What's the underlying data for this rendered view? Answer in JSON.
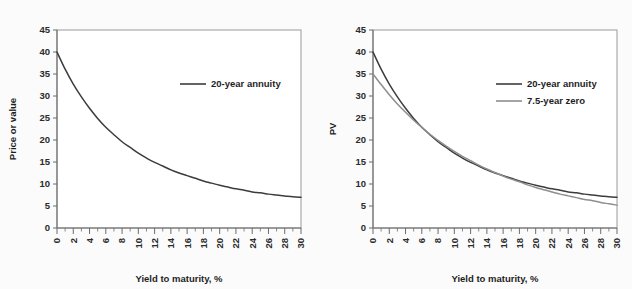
{
  "figure": {
    "background_color": "#fbfbfb",
    "panel_background_color": "#ffffff"
  },
  "colors": {
    "annuity": "#3c3c3c",
    "zero": "#8e8e8e",
    "axis": "#6d6d6d",
    "frame": "#9a9a9a",
    "text": "#1e1e1e"
  },
  "chart_data": [
    {
      "panel": "left",
      "type": "line",
      "title": "",
      "xlabel": "Yield to maturity, %",
      "ylabel": "Price or value",
      "xlim": [
        0,
        30
      ],
      "ylim": [
        0,
        45
      ],
      "xticks": [
        0,
        2,
        4,
        6,
        8,
        10,
        12,
        14,
        16,
        18,
        20,
        22,
        24,
        26,
        28,
        30
      ],
      "xticklabels": [
        "0",
        "2",
        "4",
        "6",
        "8",
        "10",
        "12",
        "14",
        "16",
        "18",
        "20",
        "22",
        "24",
        "26",
        "28",
        "30"
      ],
      "xminorticks": [
        1,
        3,
        5,
        7,
        9,
        11,
        13,
        15,
        17,
        19,
        21,
        23,
        25,
        27,
        29
      ],
      "yticks": [
        0,
        5,
        10,
        15,
        20,
        25,
        30,
        35,
        40,
        45
      ],
      "yticklabels": [
        "0",
        "5",
        "10",
        "15",
        "20",
        "25",
        "30",
        "35",
        "40",
        "45"
      ],
      "grid": false,
      "legend_position": "upper-right-inset",
      "series": [
        {
          "name": "20-year annuity",
          "color": "#3c3c3c",
          "x": [
            0,
            1,
            2,
            3,
            4,
            5,
            6,
            7,
            8,
            9,
            10,
            11,
            12,
            13,
            14,
            15,
            16,
            17,
            18,
            19,
            20,
            21,
            22,
            23,
            24,
            25,
            26,
            27,
            28,
            29,
            30
          ],
          "values": [
            40.0,
            36.1,
            32.7,
            29.8,
            27.2,
            24.9,
            22.9,
            21.2,
            19.6,
            18.3,
            17.0,
            15.9,
            14.9,
            14.1,
            13.2,
            12.5,
            11.9,
            11.3,
            10.7,
            10.2,
            9.7,
            9.3,
            8.9,
            8.6,
            8.2,
            8.0,
            7.7,
            7.5,
            7.3,
            7.1,
            7.0
          ]
        }
      ]
    },
    {
      "panel": "right",
      "type": "line",
      "title": "",
      "xlabel": "Yield to maturity, %",
      "ylabel": "PV",
      "xlim": [
        0,
        30
      ],
      "ylim": [
        0,
        45
      ],
      "xticks": [
        0,
        2,
        4,
        6,
        8,
        10,
        12,
        14,
        16,
        18,
        20,
        22,
        24,
        26,
        28,
        30
      ],
      "xticklabels": [
        "0",
        "2",
        "4",
        "6",
        "8",
        "10",
        "12",
        "14",
        "16",
        "18",
        "20",
        "22",
        "24",
        "26",
        "28",
        "30"
      ],
      "xminorticks": [
        1,
        3,
        5,
        7,
        9,
        11,
        13,
        15,
        17,
        19,
        21,
        23,
        25,
        27,
        29
      ],
      "yticks": [
        0,
        5,
        10,
        15,
        20,
        25,
        30,
        35,
        40,
        45
      ],
      "yticklabels": [
        "0",
        "5",
        "10",
        "15",
        "20",
        "25",
        "30",
        "35",
        "40",
        "45"
      ],
      "grid": false,
      "legend_position": "upper-right-inset",
      "series": [
        {
          "name": "20-year annuity",
          "color": "#3c3c3c",
          "x": [
            0,
            1,
            2,
            3,
            4,
            5,
            6,
            7,
            8,
            9,
            10,
            11,
            12,
            13,
            14,
            15,
            16,
            17,
            18,
            19,
            20,
            21,
            22,
            23,
            24,
            25,
            26,
            27,
            28,
            29,
            30
          ],
          "values": [
            40.0,
            36.1,
            32.7,
            29.8,
            27.2,
            24.9,
            22.9,
            21.2,
            19.6,
            18.3,
            17.0,
            15.9,
            14.9,
            14.1,
            13.2,
            12.5,
            11.9,
            11.3,
            10.7,
            10.2,
            9.7,
            9.3,
            8.9,
            8.6,
            8.2,
            8.0,
            7.7,
            7.5,
            7.3,
            7.1,
            7.0
          ]
        },
        {
          "name": "7.5-year zero",
          "color": "#8e8e8e",
          "x": [
            0,
            1,
            2,
            3,
            4,
            5,
            6,
            7,
            8,
            9,
            10,
            11,
            12,
            13,
            14,
            15,
            16,
            17,
            18,
            19,
            20,
            21,
            22,
            23,
            24,
            25,
            26,
            27,
            28,
            29,
            30
          ],
          "values": [
            35.0,
            32.6,
            30.3,
            28.2,
            26.3,
            24.5,
            22.9,
            21.3,
            19.9,
            18.6,
            17.4,
            16.3,
            15.3,
            14.3,
            13.4,
            12.6,
            11.8,
            11.1,
            10.5,
            9.8,
            9.2,
            8.7,
            8.2,
            7.7,
            7.3,
            6.9,
            6.5,
            6.2,
            5.8,
            5.5,
            5.2
          ]
        }
      ]
    }
  ],
  "panels": {
    "left": {
      "ylabel": "Price or value",
      "xlabel": "Yield to maturity, %",
      "legend": [
        {
          "label": "20-year annuity",
          "color": "#3c3c3c"
        }
      ]
    },
    "right": {
      "ylabel": "PV",
      "xlabel": "Yield to maturity, %",
      "legend": [
        {
          "label": "20-year annuity",
          "color": "#3c3c3c"
        },
        {
          "label": "7.5-year zero",
          "color": "#8e8e8e"
        }
      ]
    }
  }
}
